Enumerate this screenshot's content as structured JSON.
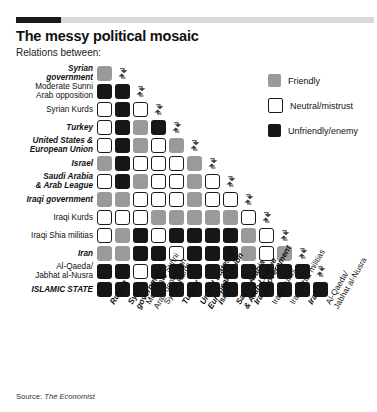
{
  "header": {
    "title": "The messy political mosaic",
    "subtitle": "Relations between:"
  },
  "legend": {
    "items": [
      {
        "key": "friendly",
        "label": "Friendly",
        "color": "#9a9a9a"
      },
      {
        "key": "neutral",
        "label": "Neutral/mistrust",
        "color": "#ffffff"
      },
      {
        "key": "enemy",
        "label": "Unfriendly/enemy",
        "color": "#161616"
      }
    ]
  },
  "source": {
    "prefix": "Source: ",
    "name": "The Economist"
  },
  "icons": {
    "relation_arrow": "exchange-arrows-icon"
  },
  "chart_data": {
    "type": "heatmap",
    "title": "The messy political mosaic",
    "subtitle": "Relations between:",
    "xlabel": "",
    "ylabel": "",
    "grid": false,
    "legend_position": "top-right",
    "value_labels": {
      "friendly": "Friendly",
      "neutral": "Neutral/mistrust",
      "enemy": "Unfriendly/enemy"
    },
    "value_colors": {
      "friendly": "#9a9a9a",
      "neutral": "#ffffff",
      "enemy": "#161616"
    },
    "columns": [
      "Russia",
      "Syrian government",
      "Moderate Sunni Arab opposition",
      "Syrian Kurds",
      "Turkey",
      "United States & European Union",
      "Israel",
      "Saudi Arabia & Arab League",
      "Iraqi government",
      "Iraqi Kurds",
      "Iraqi Shia militias",
      "Iran",
      "Al-Qaeda/Jabhat al-Nusra"
    ],
    "columns_display": [
      [
        "Russia"
      ],
      [
        "Syrian",
        "government"
      ],
      [
        "Moderate Sunni",
        "Arab opposition"
      ],
      [
        "Syrian Kurds"
      ],
      [
        "Turkey"
      ],
      [
        "United States &",
        "European Union"
      ],
      [
        "Israel"
      ],
      [
        "Saudi Arabia",
        "& Arab League"
      ],
      [
        "Iraqi government"
      ],
      [
        "Iraqi Kurds"
      ],
      [
        "Iraqi Shia militias"
      ],
      [
        "Iran"
      ],
      [
        "Al-Qaeda/",
        "Jabhat al-Nusra"
      ]
    ],
    "columns_emphasis": [
      true,
      true,
      false,
      false,
      true,
      true,
      true,
      true,
      true,
      false,
      false,
      true,
      false
    ],
    "rows": [
      "Syrian government",
      "Moderate Sunni Arab opposition",
      "Syrian Kurds",
      "Turkey",
      "United States & European Union",
      "Israel",
      "Saudi Arabia & Arab League",
      "Iraqi government",
      "Iraqi Kurds",
      "Iraqi Shia militias",
      "Iran",
      "Al-Qaeda/Jabhat al-Nusra",
      "ISLAMIC STATE"
    ],
    "rows_display": [
      [
        "Syrian",
        "government"
      ],
      [
        "Moderate Sunni",
        "Arab opposition"
      ],
      [
        "Syrian Kurds"
      ],
      [
        "Turkey"
      ],
      [
        "United States &",
        "European Union"
      ],
      [
        "Israel"
      ],
      [
        "Saudi Arabia",
        "& Arab League"
      ],
      [
        "Iraqi government"
      ],
      [
        "Iraqi Kurds"
      ],
      [
        "Iraqi Shia militias"
      ],
      [
        "Iran"
      ],
      [
        "Al-Qaeda/",
        "Jabhat al-Nusra"
      ],
      [
        "ISLAMIC STATE"
      ]
    ],
    "rows_emphasis": [
      true,
      false,
      false,
      true,
      true,
      true,
      true,
      true,
      false,
      false,
      true,
      false,
      true
    ],
    "values": [
      [
        "friendly"
      ],
      [
        "enemy",
        "enemy"
      ],
      [
        "neutral",
        "enemy",
        "neutral"
      ],
      [
        "neutral",
        "enemy",
        "friendly",
        "enemy"
      ],
      [
        "neutral",
        "enemy",
        "friendly",
        "neutral",
        "friendly"
      ],
      [
        "friendly",
        "enemy",
        "neutral",
        "neutral",
        "neutral",
        "friendly"
      ],
      [
        "neutral",
        "enemy",
        "friendly",
        "neutral",
        "neutral",
        "friendly",
        "neutral"
      ],
      [
        "friendly",
        "friendly",
        "neutral",
        "neutral",
        "neutral",
        "friendly",
        "neutral",
        "neutral"
      ],
      [
        "neutral",
        "neutral",
        "neutral",
        "friendly",
        "friendly",
        "friendly",
        "friendly",
        "friendly",
        "neutral"
      ],
      [
        "neutral",
        "friendly",
        "enemy",
        "neutral",
        "enemy",
        "enemy",
        "enemy",
        "enemy",
        "friendly",
        "neutral"
      ],
      [
        "friendly",
        "friendly",
        "enemy",
        "enemy",
        "neutral",
        "enemy",
        "enemy",
        "enemy",
        "friendly",
        "neutral",
        "friendly"
      ],
      [
        "enemy",
        "enemy",
        "neutral",
        "enemy",
        "enemy",
        "enemy",
        "enemy",
        "enemy",
        "enemy",
        "enemy",
        "enemy",
        "enemy"
      ],
      [
        "enemy",
        "enemy",
        "enemy",
        "enemy",
        "enemy",
        "enemy",
        "enemy",
        "enemy",
        "enemy",
        "enemy",
        "enemy",
        "enemy",
        "enemy"
      ]
    ]
  }
}
